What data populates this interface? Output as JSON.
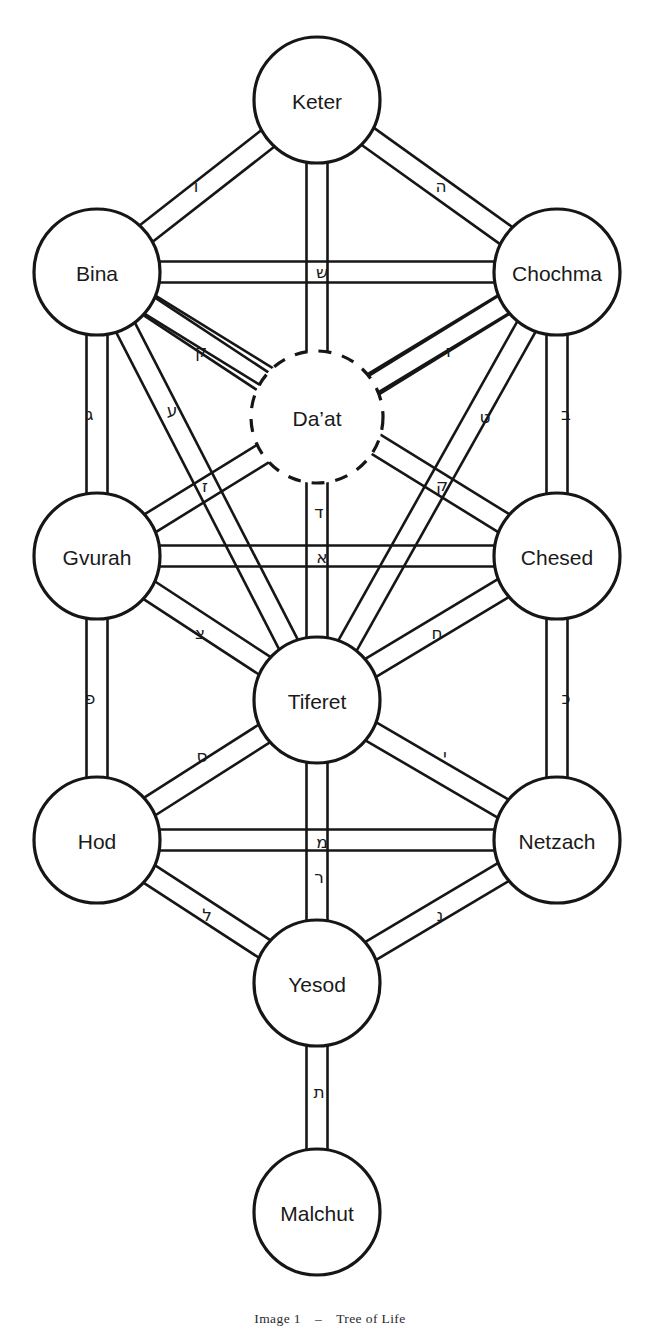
{
  "figure": {
    "title": "Tree of Life",
    "caption_prefix": "Image 1",
    "caption_dash": "–",
    "caption_title": "Tree of Life",
    "background_color": "#ffffff",
    "ink_color": "#161616",
    "width": 660,
    "height": 1330
  },
  "chart_data": {
    "type": "diagram",
    "title": "Tree of Life",
    "subtype": "kabbalistic-sefirot-graph",
    "node_count": 11,
    "edge_count": 22,
    "nodes": [
      {
        "id": "keter",
        "label": "Keter",
        "x": 317,
        "y": 100,
        "r": 63,
        "style": "solid",
        "column": "center"
      },
      {
        "id": "bina",
        "label": "Bina",
        "x": 97,
        "y": 272,
        "r": 63,
        "style": "solid",
        "column": "left"
      },
      {
        "id": "chochma",
        "label": "Chochma",
        "x": 557,
        "y": 272,
        "r": 63,
        "style": "solid",
        "column": "right"
      },
      {
        "id": "daat",
        "label": "Da’at",
        "x": 317,
        "y": 417,
        "r": 66,
        "style": "dashed",
        "column": "center"
      },
      {
        "id": "gvurah",
        "label": "Gvurah",
        "x": 97,
        "y": 556,
        "r": 63,
        "style": "solid",
        "column": "left"
      },
      {
        "id": "chesed",
        "label": "Chesed",
        "x": 557,
        "y": 556,
        "r": 63,
        "style": "solid",
        "column": "right"
      },
      {
        "id": "tiferet",
        "label": "Tiferet",
        "x": 317,
        "y": 700,
        "r": 63,
        "style": "solid",
        "column": "center"
      },
      {
        "id": "hod",
        "label": "Hod",
        "x": 97,
        "y": 840,
        "r": 63,
        "style": "solid",
        "column": "left"
      },
      {
        "id": "netzach",
        "label": "Netzach",
        "x": 557,
        "y": 840,
        "r": 63,
        "style": "solid",
        "column": "right"
      },
      {
        "id": "yesod",
        "label": "Yesod",
        "x": 317,
        "y": 983,
        "r": 63,
        "style": "solid",
        "column": "center"
      },
      {
        "id": "malchut",
        "label": "Malchut",
        "x": 317,
        "y": 1212,
        "r": 63,
        "style": "solid",
        "column": "center"
      }
    ],
    "edges": [
      {
        "id": "p-keter-bina",
        "from": "keter",
        "to": "bina",
        "letter": "ו",
        "letter_name": "vav",
        "lx": 196,
        "ly": 186
      },
      {
        "id": "p-keter-chochma",
        "from": "keter",
        "to": "chochma",
        "letter": "ה",
        "letter_name": "hey",
        "lx": 441,
        "ly": 186
      },
      {
        "id": "p-keter-daat",
        "from": "keter",
        "to": "daat",
        "letter": "",
        "letter_name": "",
        "lx": 317,
        "ly": 235
      },
      {
        "id": "p-bina-chochma",
        "from": "bina",
        "to": "chochma",
        "letter": "ש",
        "letter_name": "shin",
        "lx": 322,
        "ly": 272
      },
      {
        "id": "p-bina-gvurah",
        "from": "bina",
        "to": "gvurah",
        "letter": "ג",
        "letter_name": "gimel",
        "lx": 90,
        "ly": 414
      },
      {
        "id": "p-chochma-chesed",
        "from": "chochma",
        "to": "chesed",
        "letter": "ב",
        "letter_name": "bet",
        "lx": 566,
        "ly": 414
      },
      {
        "id": "p-bina-daat",
        "from": "bina",
        "to": "daat",
        "letter": "ק",
        "letter_name": "kuf",
        "lx": 201,
        "ly": 351
      },
      {
        "id": "p-chochma-daat",
        "from": "chochma",
        "to": "daat",
        "letter": "ז",
        "letter_name": "zayin",
        "lx": 449,
        "ly": 351
      },
      {
        "id": "p-bina-tiferet",
        "from": "bina",
        "to": "tiferet",
        "letter": "ע",
        "letter_name": "ayin",
        "lx": 172,
        "ly": 410
      },
      {
        "id": "p-chochma-tiferet",
        "from": "chochma",
        "to": "tiferet",
        "letter": "ט",
        "letter_name": "tet",
        "lx": 485,
        "ly": 417
      },
      {
        "id": "p-bina-chesed",
        "from": "bina",
        "to": "chesed",
        "letter": "ז",
        "letter_name": "zayin",
        "lx": 205,
        "ly": 486
      },
      {
        "id": "p-chochma-gvurah",
        "from": "chochma",
        "to": "gvurah",
        "letter": "ק",
        "letter_name": "kuf",
        "lx": 442,
        "ly": 485
      },
      {
        "id": "p-daat-tiferet",
        "from": "daat",
        "to": "tiferet",
        "letter": "ד",
        "letter_name": "dalet",
        "lx": 319,
        "ly": 512
      },
      {
        "id": "p-gvurah-chesed",
        "from": "gvurah",
        "to": "chesed",
        "letter": "א",
        "letter_name": "alef",
        "lx": 322,
        "ly": 557
      },
      {
        "id": "p-gvurah-tiferet",
        "from": "gvurah",
        "to": "tiferet",
        "letter": "צ",
        "letter_name": "tzadi",
        "lx": 200,
        "ly": 633
      },
      {
        "id": "p-chesed-tiferet",
        "from": "chesed",
        "to": "tiferet",
        "letter": "ח",
        "letter_name": "chet",
        "lx": 437,
        "ly": 633
      },
      {
        "id": "p-gvurah-hod",
        "from": "gvurah",
        "to": "hod",
        "letter": "פ",
        "letter_name": "pe",
        "lx": 90,
        "ly": 698
      },
      {
        "id": "p-chesed-netzach",
        "from": "chesed",
        "to": "netzach",
        "letter": "כ",
        "letter_name": "kaf",
        "lx": 566,
        "ly": 698
      },
      {
        "id": "p-hod-tiferet",
        "from": "hod",
        "to": "tiferet",
        "letter": "ס",
        "letter_name": "samech",
        "lx": 202,
        "ly": 756
      },
      {
        "id": "p-netzach-tiferet",
        "from": "netzach",
        "to": "tiferet",
        "letter": "י",
        "letter_name": "yod",
        "lx": 445,
        "ly": 755
      },
      {
        "id": "p-hod-netzach",
        "from": "hod",
        "to": "netzach",
        "letter": "מ",
        "letter_name": "mem",
        "lx": 322,
        "ly": 842
      },
      {
        "id": "p-tiferet-yesod",
        "from": "tiferet",
        "to": "yesod",
        "letter": "ר",
        "letter_name": "resh",
        "lx": 319,
        "ly": 877
      },
      {
        "id": "p-hod-yesod",
        "from": "hod",
        "to": "yesod",
        "letter": "ל",
        "letter_name": "lamed",
        "lx": 207,
        "ly": 915
      },
      {
        "id": "p-netzach-yesod",
        "from": "netzach",
        "to": "yesod",
        "letter": "נ",
        "letter_name": "nun",
        "lx": 440,
        "ly": 915
      },
      {
        "id": "p-yesod-malchut",
        "from": "yesod",
        "to": "malchut",
        "letter": "ת",
        "letter_name": "tav",
        "lx": 319,
        "ly": 1092
      }
    ],
    "legend": [],
    "grid": false
  }
}
